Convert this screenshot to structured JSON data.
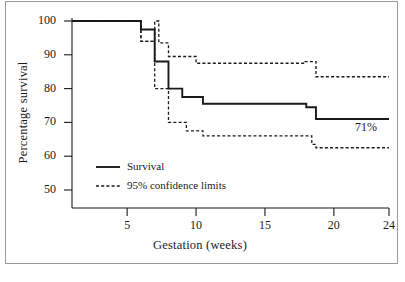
{
  "figure": {
    "ylabel": "Percentage survival",
    "xlabel": "Gestation (weeks)",
    "annotation": "71%"
  },
  "legend": {
    "items": [
      {
        "label": "Survival",
        "style": "solid"
      },
      {
        "label": "95% confidence limits",
        "style": "dashed"
      }
    ]
  },
  "ticks": {
    "y": [
      "50",
      "60",
      "70",
      "80",
      "90",
      "100"
    ],
    "x": [
      "5",
      "10",
      "15",
      "20",
      "24"
    ]
  },
  "colors": {
    "line": "#1a1a1a",
    "frame": "#9a9a9a",
    "background": "#ffffff"
  },
  "chart_data": {
    "type": "line",
    "title": "",
    "subtitle": "",
    "xlabel": "Gestation (weeks)",
    "ylabel": "Percentage survival",
    "xlim": [
      1,
      24
    ],
    "ylim": [
      45,
      100
    ],
    "xticks": [
      5,
      10,
      15,
      20,
      24
    ],
    "yticks": [
      50,
      60,
      70,
      80,
      90,
      100
    ],
    "grid": false,
    "legend_position": "lower-left-inside",
    "step_style": "post",
    "annotations": [
      {
        "text": "71%",
        "x": 23.0,
        "y": 69.5
      }
    ],
    "series": [
      {
        "name": "Survival",
        "style": "solid",
        "x": [
          1.0,
          6.0,
          7.0,
          8.0,
          9.0,
          10.5,
          18.0,
          18.7,
          24.0
        ],
        "y": [
          100.0,
          97.5,
          88.0,
          80.0,
          77.5,
          75.5,
          74.5,
          71.0,
          71.0
        ]
      },
      {
        "name": "95% confidence limits (upper)",
        "style": "dashed",
        "x": [
          1.0,
          6.0,
          7.0,
          7.3,
          8.0,
          10.0,
          17.9,
          18.7,
          24.0
        ],
        "y": [
          100.0,
          94.0,
          100.0,
          93.5,
          89.5,
          87.5,
          88.0,
          83.5,
          83.5
        ]
      },
      {
        "name": "95% confidence limits (lower)",
        "style": "dashed",
        "x": [
          1.0,
          6.0,
          7.0,
          8.0,
          9.3,
          10.5,
          17.9,
          18.4,
          18.7,
          24.0
        ],
        "y": [
          100.0,
          94.0,
          80.0,
          70.0,
          67.5,
          66.0,
          66.0,
          63.5,
          62.5,
          62.5
        ]
      }
    ]
  }
}
